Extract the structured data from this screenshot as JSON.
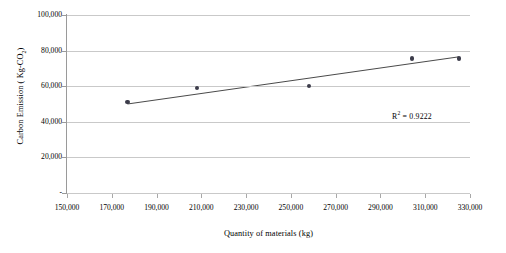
{
  "chart_data": {
    "type": "scatter",
    "title": "",
    "xlabel": "Quantity  of materials  (kg)",
    "ylabel": "Carbon Emission ( Kg-CO2)",
    "ylabel_prefix": "Carbon Emission ( Kg-CO",
    "ylabel_sub": "2",
    "ylabel_suffix": ")",
    "xlim": [
      150000,
      330000
    ],
    "ylim": [
      0,
      100000
    ],
    "grid": true,
    "legend": "none",
    "x_tick_labels": [
      "150,000",
      "170,000",
      "190,000",
      "210,000",
      "230,000",
      "250,000",
      "270,000",
      "290,000",
      "310,000",
      "330,000"
    ],
    "x_ticks": [
      150000,
      170000,
      190000,
      210000,
      230000,
      250000,
      270000,
      290000,
      310000,
      330000
    ],
    "y_tick_labels": [
      "-",
      "20,000",
      "40,000",
      "60,000",
      "80,000",
      "100,000"
    ],
    "y_ticks": [
      0,
      20000,
      40000,
      60000,
      80000,
      100000
    ],
    "points": [
      {
        "x": 177000,
        "y": 51000
      },
      {
        "x": 208000,
        "y": 59000
      },
      {
        "x": 258000,
        "y": 60000
      },
      {
        "x": 304000,
        "y": 75500
      },
      {
        "x": 325000,
        "y": 75500
      }
    ],
    "trendline": {
      "type": "linear",
      "x_start": 177000,
      "y_start": 50000,
      "x_end": 325000,
      "y_end": 76500
    },
    "annotations": [
      {
        "name": "r-squared",
        "text": "R² = 0.9222",
        "prefix": "R",
        "superscript": "2",
        "suffix": " = 0.9222",
        "value": 0.9222
      }
    ],
    "colors": {
      "marker": "#3c3c4a",
      "trendline": "#4a4a4a",
      "gridline": "#c9c9c9",
      "axis": "#9a9a9a",
      "text": "#000000",
      "background": "#ffffff"
    }
  }
}
